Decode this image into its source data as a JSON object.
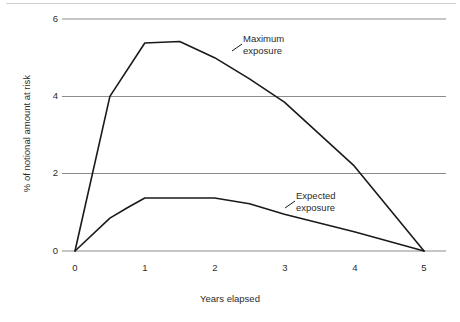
{
  "chart_data": {
    "type": "line",
    "title": "",
    "subtitle": "",
    "xlabel": "Years elapsed",
    "ylabel": "% of notional amount at risk",
    "xlim": [
      0,
      5
    ],
    "ylim": [
      0,
      6
    ],
    "xticks": [
      "0",
      "1",
      "2",
      "3",
      "4",
      "5"
    ],
    "yticks": [
      "0",
      "2",
      "4",
      "6"
    ],
    "grid": "horizontal",
    "legend_position": "inline-annotations",
    "line_color": "#1a1a1a",
    "grid_color": "#8c8c8c",
    "series": [
      {
        "name": "Maximum exposure",
        "x": [
          0,
          0.5,
          1,
          1.5,
          2,
          2.5,
          3,
          4,
          5
        ],
        "values": [
          0,
          4.0,
          5.38,
          5.42,
          5.0,
          4.45,
          3.85,
          2.2,
          0
        ]
      },
      {
        "name": "Expected exposure",
        "x": [
          0,
          0.5,
          0.75,
          1,
          1.5,
          2,
          2.5,
          3,
          4,
          5
        ],
        "values": [
          0,
          0.85,
          1.12,
          1.37,
          1.37,
          1.37,
          1.22,
          0.95,
          0.5,
          0
        ]
      }
    ],
    "annotations": [
      {
        "id": "maximum",
        "line1": "Maximum",
        "line2": "exposure"
      },
      {
        "id": "expected",
        "line1": "Expected",
        "line2": "exposure"
      }
    ]
  }
}
